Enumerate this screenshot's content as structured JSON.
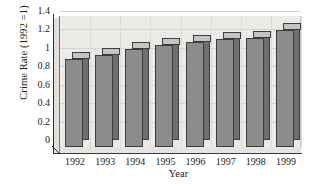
{
  "chart_data": {
    "type": "bar",
    "title": "",
    "xlabel": "Year",
    "ylabel": "Crime Rate (1992 =1)",
    "categories": [
      "1992",
      "1993",
      "1994",
      "1995",
      "1996",
      "1997",
      "1998",
      "1999"
    ],
    "values": [
      0.96,
      1.0,
      1.06,
      1.11,
      1.14,
      1.17,
      1.18,
      1.27
    ],
    "ylim": [
      0,
      1.4
    ],
    "ytick_labels": [
      "0",
      "0.2",
      "0.4",
      "0.6",
      "0.8",
      "1",
      "1.2",
      "1.4"
    ],
    "ytick_values": [
      0,
      0.2,
      0.4,
      0.6,
      0.8,
      1.0,
      1.2,
      1.4
    ],
    "grid": true,
    "legend": "none",
    "style": "3d-bar",
    "colors": {
      "bar_front": "#8c8c8c",
      "bar_side": "#6f6f6f",
      "bar_top": "#c4c4c4",
      "bar_edge": "#3d3d3d",
      "panel_background": "#eceae7",
      "gridline": "#d6d4d1",
      "axis": "#2a2a2a",
      "text": "#1a1a1a",
      "figure_background": "#ffffff"
    }
  }
}
